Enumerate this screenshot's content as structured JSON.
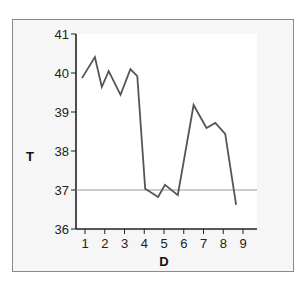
{
  "chart_data": {
    "type": "line",
    "title": "",
    "xlabel": "D",
    "ylabel": "T",
    "xlim": [
      0.45,
      9.7
    ],
    "ylim": [
      36,
      41
    ],
    "x_ticks": [
      1,
      2,
      3,
      4,
      5,
      6,
      7,
      8,
      9
    ],
    "y_ticks": [
      36,
      37,
      38,
      39,
      40,
      41
    ],
    "grid": false,
    "legend": null,
    "reference_line": {
      "y": 37,
      "color": "#999999"
    },
    "series": [
      {
        "name": "T",
        "color": "#555555",
        "x": [
          0.85,
          1.5,
          1.85,
          2.2,
          2.8,
          3.3,
          3.65,
          4.05,
          4.7,
          5.05,
          5.7,
          6.5,
          7.15,
          7.6,
          8.1,
          8.65
        ],
        "y": [
          39.87,
          40.41,
          39.64,
          40.05,
          39.44,
          40.1,
          39.92,
          37.03,
          36.82,
          37.13,
          36.87,
          39.18,
          38.59,
          38.72,
          38.44,
          36.62
        ]
      }
    ]
  }
}
